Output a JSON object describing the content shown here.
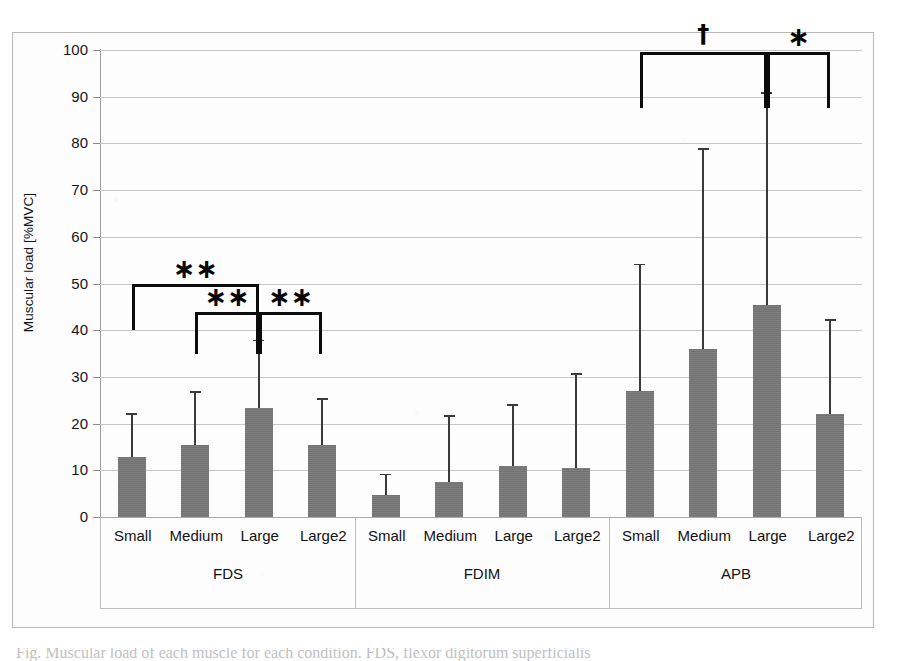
{
  "figure": {
    "caption_partial": "Fig. Muscular load of each muscle for each condition. FDS, flexor digitorum superficialis"
  },
  "chart_data": {
    "type": "bar",
    "title": "",
    "xlabel": "",
    "ylabel": "Muscular load [%MVC]",
    "ylim": [
      0,
      100
    ],
    "ytick_step": 10,
    "yticks": [
      "0",
      "10",
      "20",
      "30",
      "40",
      "50",
      "60",
      "70",
      "80",
      "90",
      "100"
    ],
    "grid": true,
    "legend": "none",
    "error_bar_style": "upper-only-SD",
    "bar_color": "#787878",
    "categories": [
      "Small",
      "Medium",
      "Large",
      "Large2"
    ],
    "groups": [
      {
        "name": "FDS",
        "values": [
          12.8,
          15.4,
          23.4,
          15.5
        ],
        "error_upper": [
          22.2,
          26.9,
          38.0,
          25.4
        ]
      },
      {
        "name": "FDIM",
        "values": [
          4.7,
          7.5,
          11.0,
          10.4
        ],
        "error_upper": [
          9.3,
          21.8,
          24.2,
          30.8
        ]
      },
      {
        "name": "APB",
        "values": [
          27.0,
          36.0,
          45.5,
          22.0
        ],
        "error_upper": [
          54.2,
          79.0,
          91.0,
          42.3
        ]
      }
    ],
    "significance": [
      {
        "group": "FDS",
        "from": "Small",
        "to": "Large",
        "mark": "∗∗"
      },
      {
        "group": "FDS",
        "from": "Medium",
        "to": "Large",
        "mark": "∗∗"
      },
      {
        "group": "FDS",
        "from": "Large",
        "to": "Large2",
        "mark": "∗∗"
      },
      {
        "group": "APB",
        "from": "Small",
        "to": "Large",
        "mark": "†"
      },
      {
        "group": "APB",
        "from": "Large",
        "to": "Large2",
        "mark": "∗"
      }
    ]
  }
}
